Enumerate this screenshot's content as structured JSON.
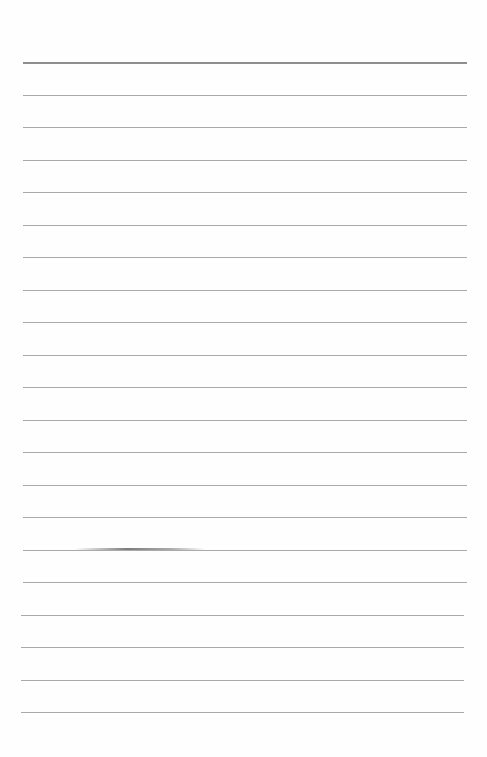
{
  "document": {
    "type": "ruled-paper",
    "line_count": 21,
    "has_header_rule": true,
    "text": "",
    "line_color": "#a9a9a9",
    "header_rule_color": "#8e8e8e"
  }
}
